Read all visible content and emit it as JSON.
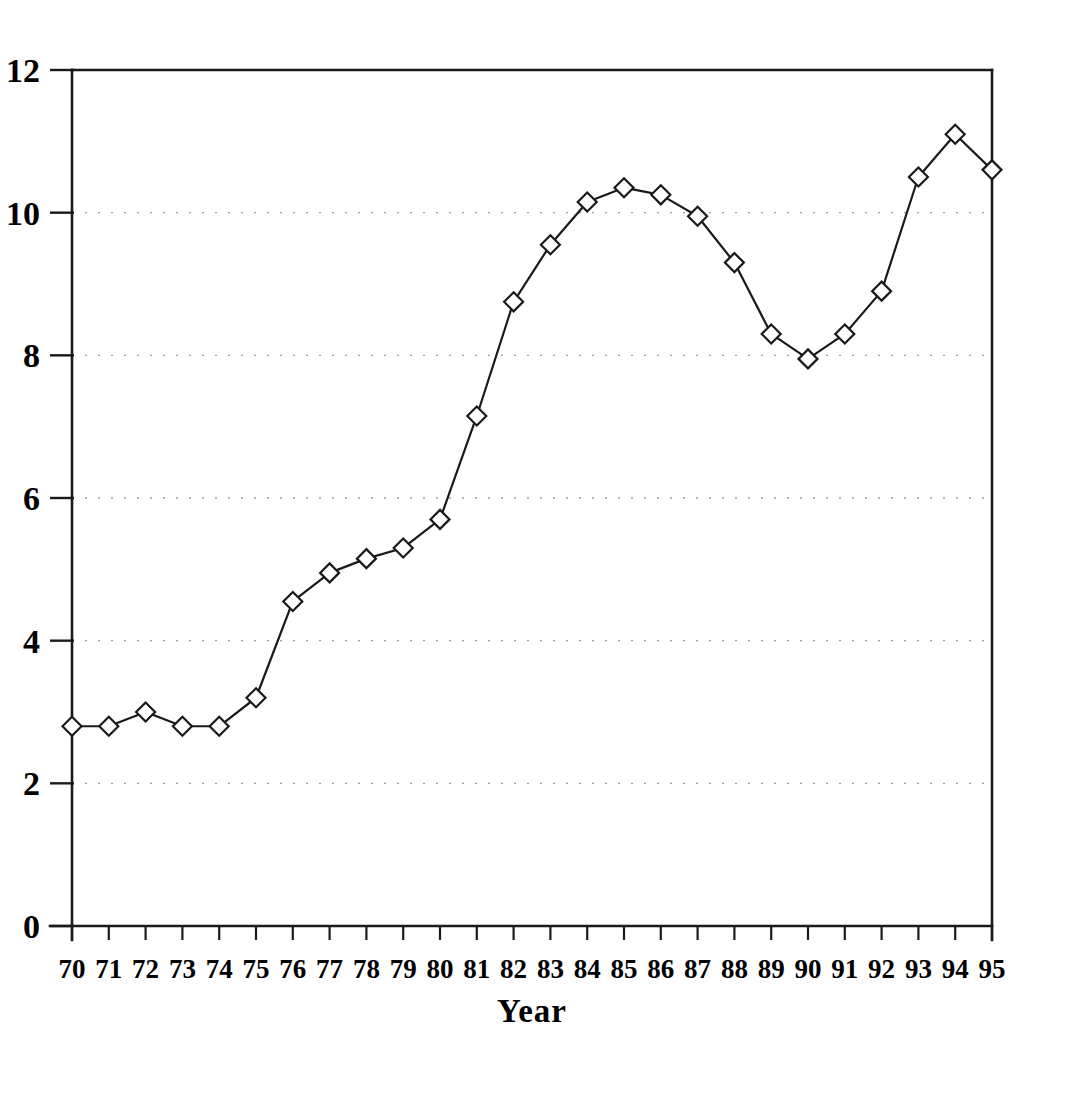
{
  "chart_data": {
    "type": "line",
    "title": "",
    "subtitle": "",
    "xlabel": "Year",
    "ylabel": "",
    "x": [
      "70",
      "71",
      "72",
      "73",
      "74",
      "75",
      "76",
      "77",
      "78",
      "79",
      "80",
      "81",
      "82",
      "83",
      "84",
      "85",
      "86",
      "87",
      "88",
      "89",
      "90",
      "91",
      "92",
      "93",
      "94",
      "95"
    ],
    "categories": [
      "70",
      "71",
      "72",
      "73",
      "74",
      "75",
      "76",
      "77",
      "78",
      "79",
      "80",
      "81",
      "82",
      "83",
      "84",
      "85",
      "86",
      "87",
      "88",
      "89",
      "90",
      "91",
      "92",
      "93",
      "94",
      "95"
    ],
    "values": [
      2.8,
      2.8,
      3.0,
      2.8,
      2.8,
      3.2,
      4.55,
      4.95,
      5.15,
      5.3,
      5.7,
      7.15,
      8.75,
      9.55,
      10.15,
      10.35,
      10.25,
      9.95,
      9.3,
      8.3,
      7.95,
      8.3,
      8.9,
      10.5,
      11.1,
      10.6
    ],
    "series": [
      {
        "name": "series-1",
        "values": [
          2.8,
          2.8,
          3.0,
          2.8,
          2.8,
          3.2,
          4.55,
          4.95,
          5.15,
          5.3,
          5.7,
          7.15,
          8.75,
          9.55,
          10.15,
          10.35,
          10.25,
          9.95,
          9.3,
          8.3,
          7.95,
          8.3,
          8.9,
          10.5,
          11.1,
          10.6
        ],
        "marker": "diamond",
        "marker_fill": "#ffffff",
        "line_color": "#1a1a1a"
      }
    ],
    "ylim": [
      0,
      12
    ],
    "yticks": [
      0,
      2,
      4,
      6,
      8,
      10,
      12
    ],
    "ytick_labels": [
      "0",
      "2",
      "4",
      "6",
      "8",
      "10",
      "12"
    ],
    "xtick_labels": [
      "70",
      "71",
      "72",
      "73",
      "74",
      "75",
      "76",
      "77",
      "78",
      "79",
      "80",
      "81",
      "82",
      "83",
      "84",
      "85",
      "86",
      "87",
      "88",
      "89",
      "90",
      "91",
      "92",
      "93",
      "94",
      "95"
    ],
    "grid": {
      "horizontal": true,
      "vertical": false,
      "style": "dotted",
      "color": "#9a9a9a"
    },
    "legend": {
      "visible": false,
      "position": "none",
      "entries": []
    },
    "annotations": [],
    "axis_color": "#1a1a1a",
    "plot_border": [
      "left",
      "right",
      "top",
      "bottom"
    ],
    "background": "#ffffff"
  },
  "axes": {
    "y_title": "",
    "x_title": "Year"
  }
}
